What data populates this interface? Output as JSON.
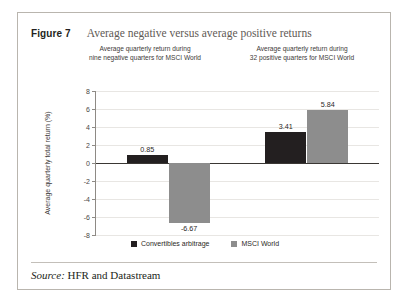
{
  "figure": {
    "number_label": "Figure 7",
    "title": "Average negative versus average positive returns",
    "source_label": "Source:",
    "source_text": "HFR and Datastream"
  },
  "chart_data": {
    "type": "bar",
    "title": "Average negative versus average positive returns",
    "xlabel": "",
    "ylabel": "Average quarterly total return (%)",
    "ylim": [
      -8,
      8
    ],
    "ytick_step": 2,
    "ytick_labels": [
      "8",
      "6",
      "4",
      "2",
      "0",
      "-2",
      "-4",
      "-6",
      "-8"
    ],
    "ytick_values": [
      8,
      6,
      4,
      2,
      0,
      -2,
      -4,
      -6,
      -8
    ],
    "grid": true,
    "legend_position": "bottom",
    "categories": [
      "Average quarterly return during nine negative quarters for MSCI World",
      "Average quarterly return during 32 positive quarters for MSCI World"
    ],
    "group_captions": [
      "Average quarterly return during\nnine negative quarters for MSCI World",
      "Average quarterly return during\n32 positive quarters for MSCI World"
    ],
    "series": [
      {
        "name": "Convertibles arbitrage",
        "color": "#231f20",
        "values": [
          0.85,
          3.41
        ],
        "value_labels": [
          "0.85",
          "3.41"
        ]
      },
      {
        "name": "MSCI World",
        "color": "#8d8d8d",
        "values": [
          -6.67,
          5.84
        ],
        "value_labels": [
          "-6.67",
          "5.84"
        ]
      }
    ]
  }
}
